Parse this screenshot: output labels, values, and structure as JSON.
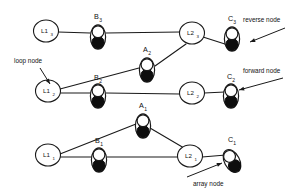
{
  "diagram": {
    "background_color": "#ffffff",
    "ink_color": "#1a1a1a",
    "fill_dark": "#0d0d0d",
    "fill_light": "#ffffff",
    "annotations": [
      {
        "id": "loop-node",
        "text": "loop node",
        "text_x": 14,
        "text_y": 63,
        "line": [
          40,
          68,
          50,
          84
        ],
        "points_to": "L1_2"
      },
      {
        "id": "reverse-node",
        "text": "reverse node",
        "text_x": 243,
        "text_y": 22,
        "line": [
          285,
          28,
          250,
          42
        ],
        "points_to": "C3_black"
      },
      {
        "id": "forward-node",
        "text": "forward node",
        "text_x": 243,
        "text_y": 73,
        "line": [
          283,
          78,
          239,
          90
        ],
        "points_to": "C2_white"
      },
      {
        "id": "array-node",
        "text": "array node",
        "text_x": 193,
        "text_y": 186,
        "line": [
          187,
          177,
          222,
          163
        ],
        "points_to": "C1_black"
      }
    ],
    "loop_nodes": [
      {
        "id": "L1_3",
        "label": "L1",
        "sub": "3",
        "cx": 46,
        "cy": 31,
        "rx": 12.5,
        "ry": 11
      },
      {
        "id": "L2_3",
        "label": "L2",
        "sub": "3",
        "cx": 192,
        "cy": 33,
        "rx": 12.5,
        "ry": 11
      },
      {
        "id": "L1_2",
        "label": "L1",
        "sub": "2",
        "cx": 48,
        "cy": 91,
        "rx": 12.5,
        "ry": 11
      },
      {
        "id": "L2_2",
        "label": "L2",
        "sub": "2",
        "cx": 192,
        "cy": 93,
        "rx": 12.5,
        "ry": 11
      },
      {
        "id": "L1_1",
        "label": "L1",
        "sub": "1",
        "cx": 48,
        "cy": 155,
        "rx": 12.5,
        "ry": 11
      },
      {
        "id": "L2_1",
        "label": "L2",
        "sub": "1",
        "cx": 190,
        "cy": 156,
        "rx": 12.5,
        "ry": 11
      }
    ],
    "cell_nodes": [
      {
        "id": "B_3",
        "label": "B",
        "sub": "3",
        "cx": 98,
        "cy": 37,
        "rot": 0,
        "label_x": 94,
        "label_y": 19
      },
      {
        "id": "C_3",
        "label": "C",
        "sub": "3",
        "cx": 232,
        "cy": 39,
        "rot": 0,
        "label_x": 228,
        "label_y": 21
      },
      {
        "id": "A_2",
        "label": "A",
        "sub": "2",
        "cx": 147,
        "cy": 70,
        "rot": 0,
        "label_x": 143,
        "label_y": 52
      },
      {
        "id": "B_2",
        "label": "B",
        "sub": "2",
        "cx": 98,
        "cy": 96,
        "rot": 0,
        "label_x": 94,
        "label_y": 80
      },
      {
        "id": "C_2",
        "label": "C",
        "sub": "2",
        "cx": 231,
        "cy": 96,
        "rot": 0,
        "label_x": 227,
        "label_y": 79
      },
      {
        "id": "A_1",
        "label": "A",
        "sub": "1",
        "cx": 143,
        "cy": 126,
        "rot": 0,
        "label_x": 139,
        "label_y": 108
      },
      {
        "id": "B_1",
        "label": "B",
        "sub": "1",
        "cx": 99,
        "cy": 160,
        "rot": 0,
        "label_x": 95,
        "label_y": 143
      },
      {
        "id": "C_1",
        "label": "C",
        "sub": "1",
        "cx": 232,
        "cy": 161,
        "rot": -28,
        "label_x": 228,
        "label_y": 142
      }
    ],
    "edges": [
      {
        "id": "e-L1_3-B_3",
        "from": "L1_3",
        "to": "B_3",
        "x1": 58,
        "y1": 32,
        "x2": 90,
        "y2": 33
      },
      {
        "id": "e-B_3-L2_3",
        "from": "B_3",
        "to": "L2_3",
        "x1": 106,
        "y1": 33,
        "x2": 180,
        "y2": 32
      },
      {
        "id": "e-L2_3-C_3",
        "from": "L2_3",
        "to": "C_3",
        "x1": 203,
        "y1": 37,
        "x2": 228,
        "y2": 45
      },
      {
        "id": "e-L1_2-A_2",
        "from": "L1_2",
        "to": "A_2",
        "x1": 60,
        "y1": 89,
        "x2": 139,
        "y2": 68
      },
      {
        "id": "e-A_2-L2_3",
        "from": "A_2",
        "to": "L2_3",
        "x1": 155,
        "y1": 66,
        "x2": 186,
        "y2": 44
      },
      {
        "id": "e-L1_2-B_2",
        "from": "L1_2",
        "to": "B_2",
        "x1": 60,
        "y1": 93,
        "x2": 91,
        "y2": 93
      },
      {
        "id": "e-B_2-L2_2",
        "from": "B_2",
        "to": "L2_2",
        "x1": 106,
        "y1": 93,
        "x2": 180,
        "y2": 94
      },
      {
        "id": "e-L2_2-C_2",
        "from": "L2_2",
        "to": "C_2",
        "x1": 204,
        "y1": 93,
        "x2": 225,
        "y2": 92
      },
      {
        "id": "e-L1_1-A_1",
        "from": "L1_1",
        "to": "A_1",
        "x1": 60,
        "y1": 154,
        "x2": 136,
        "y2": 124
      },
      {
        "id": "e-A_1-L2_1",
        "from": "A_1",
        "to": "L2_1",
        "x1": 150,
        "y1": 128,
        "x2": 184,
        "y2": 148
      },
      {
        "id": "e-L1_1-B_1",
        "from": "L1_1",
        "to": "B_1",
        "x1": 60,
        "y1": 157,
        "x2": 92,
        "y2": 157
      },
      {
        "id": "e-B_1-L2_1",
        "from": "B_1",
        "to": "L2_1",
        "x1": 107,
        "y1": 157,
        "x2": 178,
        "y2": 157
      },
      {
        "id": "e-L2_1-C_1",
        "from": "L2_1",
        "to": "C_1",
        "x1": 202,
        "y1": 157,
        "x2": 226,
        "y2": 155
      }
    ]
  }
}
